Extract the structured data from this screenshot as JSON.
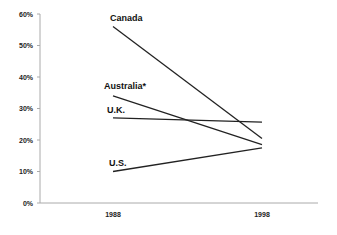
{
  "chart_data": {
    "type": "line",
    "title": "",
    "xlabel": "",
    "ylabel": "",
    "categories": [
      "1988",
      "1998"
    ],
    "ylim": [
      0,
      60
    ],
    "y_ticks": [
      "0%",
      "10%",
      "20%",
      "30%",
      "40%",
      "50%",
      "60%"
    ],
    "y_tick_values": [
      0,
      10,
      20,
      30,
      40,
      50,
      60
    ],
    "grid": false,
    "legend": "none (direct line labels at 1988 start)",
    "series": [
      {
        "name": "Canada",
        "values": [
          56,
          20.5
        ]
      },
      {
        "name": "Australia*",
        "values": [
          34,
          18.5
        ]
      },
      {
        "name": "U.K.",
        "values": [
          27,
          25.7
        ]
      },
      {
        "name": "U.S.",
        "values": [
          10,
          17.5
        ]
      }
    ]
  },
  "layout": {
    "plot_left": 40,
    "plot_right": 318,
    "y_zero": 203,
    "y_top": 14,
    "x_positions": [
      113,
      262
    ],
    "label_offsets": [
      {
        "dx": -3,
        "dy": -6
      },
      {
        "dx": -9,
        "dy": -7
      },
      {
        "dx": -6,
        "dy": -5
      },
      {
        "dx": -4,
        "dy": -6
      }
    ]
  }
}
